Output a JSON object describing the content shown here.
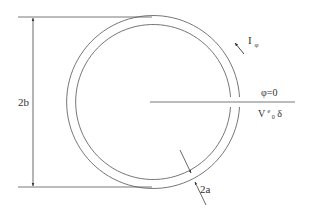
{
  "diagram": {
    "labels": {
      "height": "2b",
      "current": "I",
      "current_sub": "φ",
      "angle_zero": "φ=0",
      "voltage_main": "V",
      "voltage_sup": "e",
      "voltage_sub": "0",
      "voltage_tail": "δ",
      "thickness": "2a"
    },
    "colors": {
      "stroke": "#555555",
      "text": "#333333",
      "background": "#ffffff"
    }
  }
}
